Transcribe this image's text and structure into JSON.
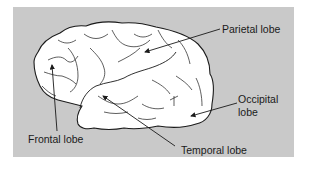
{
  "figure": {
    "background_color": "#c9c9c9",
    "brain_fill": "#ffffff",
    "line_color": "#1a1a1a"
  },
  "labels": {
    "parietal": "Parietal lobe",
    "occipital_line1": "Occipital",
    "occipital_line2": "lobe",
    "frontal": "Frontal lobe",
    "temporal": "Temporal lobe"
  }
}
